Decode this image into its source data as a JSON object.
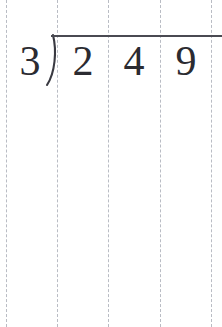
{
  "worksheet": {
    "title": "Long division problem",
    "paper": {
      "background_color": "#ffffff",
      "guide_line_color": "#b9bcc4",
      "guide_line_style": "dashed",
      "guide_line_positions": [
        6,
        57,
        108,
        160,
        211
      ],
      "columns": 4
    },
    "problem": {
      "operation": "long-division",
      "divisor": "3",
      "dividend": "249",
      "dividend_digits": [
        "2",
        "4",
        "9"
      ],
      "quotient": "",
      "expression": "3)249",
      "ink_color": "#2b2b31",
      "rule_color": "#4a4a52",
      "bracket_icon": "division-bracket-icon",
      "vinculum_label": "division-bar"
    }
  }
}
